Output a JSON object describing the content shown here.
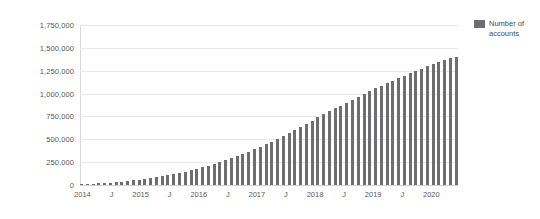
{
  "chart_data": {
    "type": "bar",
    "title": "",
    "xlabel": "",
    "ylabel": "",
    "ylim": [
      0,
      1750000
    ],
    "grid": true,
    "legend_position": "top-right",
    "series": [
      {
        "name": "Number of accounts",
        "color": "#6e6e70",
        "values": [
          8000,
          11000,
          14000,
          18000,
          22000,
          27000,
          32000,
          38000,
          44000,
          51000,
          58000,
          66000,
          75000,
          84000,
          94000,
          105000,
          117000,
          130000,
          144000,
          159000,
          175000,
          192000,
          210000,
          229000,
          249000,
          270000,
          292000,
          315000,
          339000,
          364000,
          390000,
          417000,
          445000,
          474000,
          504000,
          535000,
          567000,
          600000,
          634000,
          669000,
          705000,
          742000,
          780000,
          808000,
          837000,
          867000,
          898000,
          930000,
          963000,
          997000,
          1032000,
          1058000,
          1085000,
          1113000,
          1142000,
          1172000,
          1196000,
          1221000,
          1247000,
          1274000,
          1302000,
          1321000,
          1341000,
          1362000,
          1384000,
          1400000
        ],
        "x": [
          "2014-01",
          "2014-02",
          "2014-03",
          "2014-04",
          "2014-05",
          "2014-06",
          "2014-07",
          "2014-08",
          "2014-09",
          "2014-10",
          "2014-11",
          "2014-12",
          "2015-01",
          "2015-02",
          "2015-03",
          "2015-04",
          "2015-05",
          "2015-06",
          "2015-07",
          "2015-08",
          "2015-09",
          "2015-10",
          "2015-11",
          "2015-12",
          "2016-01",
          "2016-02",
          "2016-03",
          "2016-04",
          "2016-05",
          "2016-06",
          "2016-07",
          "2016-08",
          "2016-09",
          "2016-10",
          "2016-11",
          "2016-12",
          "2017-01",
          "2017-02",
          "2017-03",
          "2017-04",
          "2017-05",
          "2017-06",
          "2017-07",
          "2017-08",
          "2017-09",
          "2017-10",
          "2017-11",
          "2017-12",
          "2018-01",
          "2018-02",
          "2018-03",
          "2018-04",
          "2018-05",
          "2018-06",
          "2018-07",
          "2018-08",
          "2018-09",
          "2018-10",
          "2018-11",
          "2018-12",
          "2019-01",
          "2019-02",
          "2019-03",
          "2019-04",
          "2019-05",
          "2019-06"
        ]
      }
    ],
    "yticks": [
      {
        "value": 1750000,
        "label": "1,750,000"
      },
      {
        "value": 1500000,
        "label": "1,500,000"
      },
      {
        "value": 1250000,
        "label": "1,250,000"
      },
      {
        "value": 1000000,
        "label": "1,000,000"
      },
      {
        "value": 750000,
        "label": "750,000"
      },
      {
        "value": 500000,
        "label": "500,000"
      },
      {
        "value": 250000,
        "label": "250,000"
      },
      {
        "value": 0,
        "label": "0"
      }
    ],
    "xticks": [
      {
        "index": 0,
        "label": "2014"
      },
      {
        "index": 6,
        "label": "J"
      },
      {
        "index": 12,
        "label": "2015"
      },
      {
        "index": 18,
        "label": "J"
      },
      {
        "index": 24,
        "label": "2016"
      },
      {
        "index": 30,
        "label": "J"
      },
      {
        "index": 36,
        "label": "2017"
      },
      {
        "index": 42,
        "label": "J"
      },
      {
        "index": 48,
        "label": "2018"
      },
      {
        "index": 54,
        "label": "J"
      },
      {
        "index": 60,
        "label": "2019"
      },
      {
        "index": 66,
        "label": "J"
      },
      {
        "index": 72,
        "label": "2020"
      }
    ]
  },
  "legend": {
    "entries": [
      {
        "label": "Number of accounts",
        "color": "#6e6e70"
      }
    ]
  }
}
